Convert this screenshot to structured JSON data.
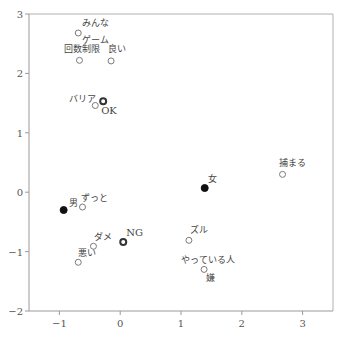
{
  "chart_data": {
    "type": "scatter",
    "title": "",
    "xlabel": "",
    "ylabel": "",
    "xlim": [
      -1.5,
      3.5
    ],
    "ylim": [
      -2,
      3
    ],
    "x_ticks": [
      -1,
      0,
      1,
      2,
      3
    ],
    "y_ticks": [
      -2,
      -1,
      0,
      1,
      2,
      3
    ],
    "grid": false,
    "legend": null,
    "points": [
      {
        "label": "みんな",
        "x": -0.69,
        "y": 2.68,
        "style": "open",
        "lx": 4,
        "ly": -7
      },
      {
        "label": "ゲーム",
        "x": -0.67,
        "y": 2.45,
        "style": "none",
        "lx": 3,
        "ly": -4
      },
      {
        "label": "回数制限",
        "x": -0.67,
        "y": 2.22,
        "style": "open",
        "lx": -15,
        "ly": -8
      },
      {
        "label": "良い",
        "x": -0.15,
        "y": 2.21,
        "style": "open",
        "lx": -3,
        "ly": -9
      },
      {
        "label": "バリア",
        "x": -0.41,
        "y": 1.46,
        "style": "open",
        "lx": -26,
        "ly": -3
      },
      {
        "label": "OK",
        "x": -0.28,
        "y": 1.53,
        "style": "bold",
        "lx": -2,
        "ly": 13
      },
      {
        "label": "男",
        "x": -0.93,
        "y": -0.3,
        "style": "filled",
        "lx": 5,
        "ly": -4
      },
      {
        "label": "ずっと",
        "x": -0.62,
        "y": -0.25,
        "style": "open",
        "lx": -2,
        "ly": -6
      },
      {
        "label": "ダメ",
        "x": -0.44,
        "y": -0.91,
        "style": "open",
        "lx": 1,
        "ly": -6
      },
      {
        "label": "悪い",
        "x": -0.69,
        "y": -1.18,
        "style": "open",
        "lx": 0,
        "ly": -6
      },
      {
        "label": "NG",
        "x": 0.05,
        "y": -0.84,
        "style": "bold",
        "lx": 3,
        "ly": -6
      },
      {
        "label": "女",
        "x": 1.39,
        "y": 0.07,
        "style": "filled",
        "lx": 3,
        "ly": -6
      },
      {
        "label": "捕まる",
        "x": 2.67,
        "y": 0.3,
        "style": "open",
        "lx": -4,
        "ly": -8
      },
      {
        "label": "ズル",
        "x": 1.13,
        "y": -0.81,
        "style": "open",
        "lx": 1,
        "ly": -7
      },
      {
        "label": "やっている人",
        "x": 1.38,
        "y": -1.3,
        "style": "open",
        "lx": -23,
        "ly": -6
      },
      {
        "label": "嫌",
        "x": 1.38,
        "y": -1.3,
        "style": "none",
        "lx": 2,
        "ly": 12
      }
    ],
    "colors": {
      "axis": "#9a9a9a",
      "frame": "#b0b0b0",
      "marker": "#7a7a7a",
      "marker_bold": "#333333",
      "marker_filled": "#111111",
      "text": "#444444"
    }
  }
}
